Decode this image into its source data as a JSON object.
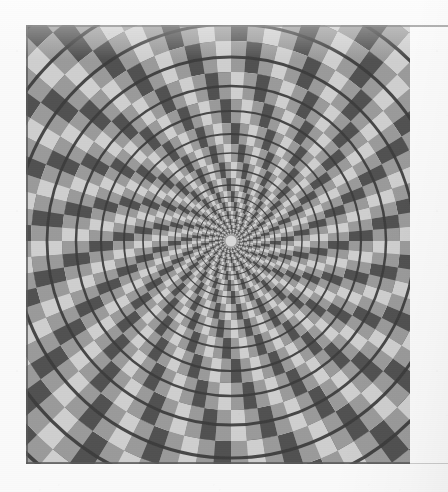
{
  "page": {
    "background_color": "#fafafa",
    "kind": "scanned-book-plate"
  },
  "plate": {
    "name": "fraser-spiral-illusion",
    "frame": {
      "x": 26,
      "y": 25,
      "width": 384,
      "height": 439
    },
    "border_color": "#5a5a5a",
    "caption": ""
  },
  "chart_data": {
    "type": "scatter",
    "title": "",
    "subtitle": "",
    "xlabel": "",
    "ylabel": "",
    "grid": false,
    "legend": null,
    "illusion_name": "Fraser spiral (twisted cord) illusion",
    "center": {
      "x": 205,
      "y": 216
    },
    "palette": {
      "light": "#cfcfcf",
      "mid": "#9a9a9a",
      "dark": "#515151",
      "cord": "#3c3c3c",
      "core": "#d8d8d8",
      "background": "#fafafa"
    },
    "radial_sectors": 40,
    "ring_count": 17,
    "ring_radii": [
      7,
      11,
      16,
      22,
      30,
      39,
      50,
      63,
      79,
      97,
      118,
      142,
      169,
      200,
      235,
      274,
      318
    ],
    "cord_radii": [
      9,
      13,
      19,
      26,
      34,
      44,
      56,
      71,
      88,
      107,
      130,
      155,
      184,
      217,
      254,
      295,
      340
    ],
    "cord_stroke_widths": [
      0.6,
      0.7,
      0.8,
      0.9,
      1.0,
      1.1,
      1.3,
      1.5,
      1.7,
      1.9,
      2.2,
      2.5,
      2.8,
      3.1,
      3.4,
      3.7,
      4.0
    ],
    "sector_twist_per_ring_deg": 4.5
  }
}
